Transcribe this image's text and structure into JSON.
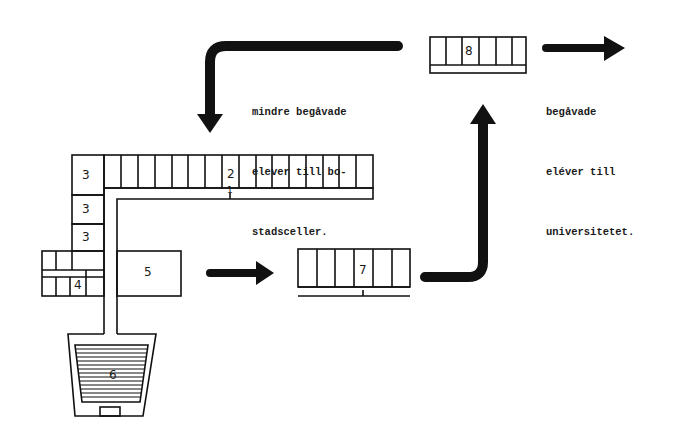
{
  "diagram": {
    "type": "school-flow-plan",
    "ink_color": "#111111",
    "background": "#ffffff",
    "labels": {
      "building_1": "1",
      "building_2": "2",
      "building_3a": "3",
      "building_3b": "3",
      "building_3c": "3",
      "building_4": "4",
      "building_5": "5",
      "building_6": "6",
      "building_7": "7",
      "building_8": "8"
    },
    "captions": {
      "left_line1": "mindre begåvade",
      "left_line2": "elever till bo-",
      "left_line3": "stadsceller.",
      "right_line1": "begåvade",
      "right_line2": "eléver till",
      "right_line3": "universitetet."
    },
    "arrows": [
      {
        "name": "arrow-5-to-7",
        "direction": "right"
      },
      {
        "name": "arrow-7-to-8",
        "direction": "up"
      },
      {
        "name": "arrow-8-to-university",
        "direction": "right"
      },
      {
        "name": "arrow-8-to-housing-cells",
        "direction": "down-left"
      }
    ]
  }
}
